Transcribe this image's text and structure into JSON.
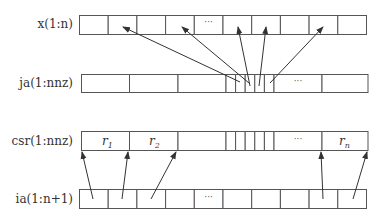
{
  "diagram": {
    "title": "",
    "rows": [
      {
        "id": "x",
        "label": "x(1:n)",
        "ellipsis_cell": 4
      },
      {
        "id": "ja",
        "label": "ja(1:nnz)",
        "ellipsis": "···"
      },
      {
        "id": "csr",
        "label": "csr(1:nnz)",
        "cells": [
          {
            "text": "r",
            "sub": "1"
          },
          {
            "text": "r",
            "sub": "2"
          },
          {
            "text": "",
            "sub": ""
          },
          {
            "text": "···",
            "sub": ""
          },
          {
            "text": "r",
            "sub": "n"
          }
        ]
      },
      {
        "id": "ia",
        "label": "ia(1:n+1)",
        "ellipsis_cell": 4
      }
    ],
    "ellipsis": "···",
    "arrows": {
      "ja_to_x": 5,
      "ia_to_csr": 5
    }
  }
}
